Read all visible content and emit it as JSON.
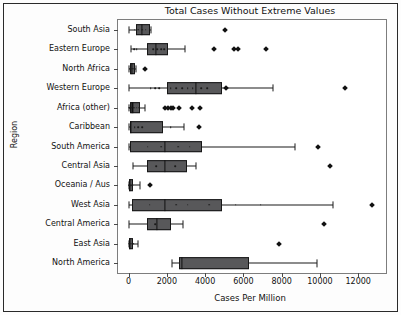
{
  "chart_data": {
    "type": "box",
    "title": "Total Cases Without Extreme Values",
    "xlabel": "Cases Per Million",
    "ylabel": "Region",
    "xlim": [
      -550,
      13450
    ],
    "xticks": [
      0,
      2000,
      4000,
      6000,
      8000,
      10000,
      12000
    ],
    "xtick_labels": [
      "0",
      "2000",
      "4000",
      "6000",
      "8000",
      "10000",
      "12000"
    ],
    "grid": false,
    "legend": null,
    "orientation": "horizontal",
    "categories": [
      "South Asia",
      "Eastern Europe",
      "North Africa",
      "Western Europe",
      "Africa (other)",
      "Caribbean",
      "South America",
      "Central Asia",
      "Oceania / Aus",
      "West Asia",
      "Central America",
      "East Asia",
      "North America"
    ],
    "boxes": [
      {
        "label": "South Asia",
        "whisker_low": 20,
        "q1": 400,
        "median": 700,
        "q3": 1120,
        "whisker_high": 1180,
        "fliers": [
          5050
        ],
        "points": [
          330,
          520,
          700,
          900
        ]
      },
      {
        "label": "Eastern Europe",
        "whisker_low": 120,
        "q1": 970,
        "median": 1420,
        "q3": 2080,
        "whisker_high": 2930,
        "fliers": [
          4480,
          5500,
          5740,
          7180
        ],
        "points": [
          300,
          420,
          1000,
          1300,
          1500,
          1700,
          1850
        ]
      },
      {
        "label": "North Africa",
        "whisker_low": 20,
        "q1": 60,
        "median": 170,
        "q3": 330,
        "whisker_high": 380,
        "fliers": [
          840
        ],
        "points": [
          90,
          180,
          300
        ]
      },
      {
        "label": "Western Europe",
        "whisker_low": 30,
        "q1": 1990,
        "median": 3520,
        "q3": 4900,
        "whisker_high": 7530,
        "fliers": [
          5080,
          11300
        ],
        "points": [
          1150,
          1400,
          1600,
          2200,
          2500,
          2800,
          3100,
          3350,
          3800,
          4100
        ]
      },
      {
        "label": "Africa (other)",
        "whisker_low": 10,
        "q1": 70,
        "median": 200,
        "q3": 620,
        "whisker_high": 840,
        "fliers": [
          1920,
          2080,
          2200,
          2320,
          2620,
          3300,
          3720
        ],
        "points": [
          40,
          90,
          140,
          230,
          320,
          420,
          530
        ]
      },
      {
        "label": "Caribbean",
        "whisker_low": 30,
        "q1": 60,
        "median": 140,
        "q3": 1780,
        "whisker_high": 2900,
        "fliers": [
          3700
        ],
        "points": [
          330,
          520,
          700,
          2200
        ]
      },
      {
        "label": "South America",
        "whisker_low": 30,
        "q1": 60,
        "median": 1920,
        "q3": 3820,
        "whisker_high": 8680,
        "fliers": [
          9900
        ],
        "points": [
          1000,
          1700,
          2600,
          3200
        ]
      },
      {
        "label": "Central Asia",
        "whisker_low": 240,
        "q1": 960,
        "median": 1920,
        "q3": 3060,
        "whisker_high": 3500,
        "fliers": [
          10500
        ],
        "points": [
          1450,
          2450
        ]
      },
      {
        "label": "Oceania / Aus",
        "whisker_low": 10,
        "q1": 30,
        "median": 90,
        "q3": 220,
        "whisker_high": 600,
        "fliers": [
          1100
        ],
        "points": [
          40,
          120,
          190
        ]
      },
      {
        "label": "West Asia",
        "whisker_low": 20,
        "q1": 180,
        "median": 1920,
        "q3": 4880,
        "whisker_high": 10700,
        "fliers": [
          12700
        ],
        "points": [
          1100,
          2500,
          3100,
          4200,
          5600,
          6900
        ]
      },
      {
        "label": "Central America",
        "whisker_low": 40,
        "q1": 960,
        "median": 1500,
        "q3": 2220,
        "whisker_high": 2830,
        "fliers": [
          10200
        ],
        "points": [
          1380
        ]
      },
      {
        "label": "East Asia",
        "whisker_low": 10,
        "q1": 30,
        "median": 90,
        "q3": 210,
        "whisker_high": 500,
        "fliers": [
          7850
        ],
        "points": [
          50,
          110,
          170,
          250
        ]
      },
      {
        "label": "North America",
        "whisker_low": 2280,
        "q1": 2620,
        "median": 2800,
        "q3": 6300,
        "whisker_high": 9850,
        "fliers": [],
        "points": []
      }
    ]
  }
}
